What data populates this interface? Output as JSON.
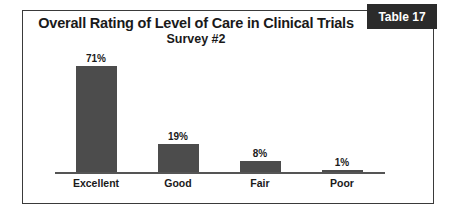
{
  "badge": {
    "label": "Table 17"
  },
  "chart_data": {
    "type": "bar",
    "title": "Overall Rating of Level of Care in Clinical Trials",
    "subtitle": "Survey #2",
    "xlabel": "",
    "ylabel": "",
    "ylim": [
      0,
      80
    ],
    "grid": false,
    "legend": false,
    "bar_color": "#4c4c4c",
    "axis_color": "#555555",
    "categories": [
      "Excellent",
      "Good",
      "Fair",
      "Poor"
    ],
    "values": [
      71,
      19,
      8,
      1
    ],
    "data_labels": [
      "71%",
      "19%",
      "8%",
      "1%"
    ]
  }
}
